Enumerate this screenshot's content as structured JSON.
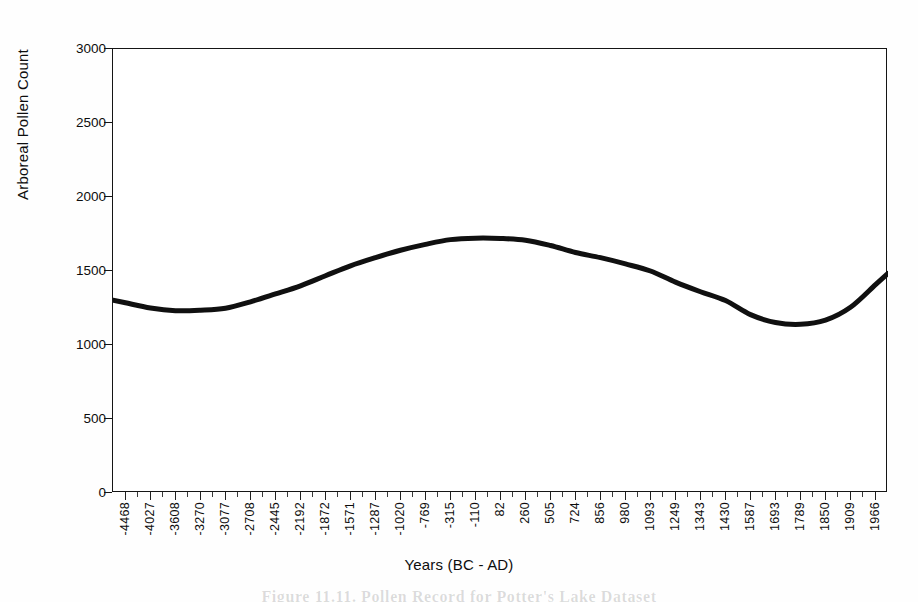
{
  "chart_data": {
    "type": "line",
    "title": "",
    "xlabel": "Years (BC - AD)",
    "ylabel": "Arboreal Pollen Count",
    "ylim": [
      0,
      3000
    ],
    "yticks": [
      0,
      500,
      1000,
      1500,
      2000,
      2500,
      3000
    ],
    "grid": false,
    "legend": null,
    "line_color": "#101010",
    "line_width_px": 5,
    "categories": [
      "-4468",
      "-4027",
      "-3608",
      "-3270",
      "-3077",
      "-2708",
      "-2445",
      "-2192",
      "-1872",
      "-1571",
      "-1287",
      "-1020",
      "-769",
      "-315",
      "-110",
      "82",
      "260",
      "505",
      "724",
      "856",
      "980",
      "1093",
      "1249",
      "1343",
      "1430",
      "1587",
      "1693",
      "1789",
      "1850",
      "1909",
      "1966"
    ],
    "tick_labels": [
      "-4468",
      "-4027",
      "-3608",
      "-3270",
      "-3077",
      "-2708",
      "-2445",
      "-2192",
      "-1872",
      "-1571",
      "-1287",
      "-1020",
      "-769",
      "-315",
      "-110",
      "82",
      "260",
      "505",
      "724",
      "856",
      "980",
      "1093",
      "1249",
      "1343",
      "1430",
      "1587",
      "1693",
      "1789",
      "1850",
      "1909",
      "1966"
    ],
    "values": [
      1285,
      1250,
      1232,
      1235,
      1248,
      1292,
      1345,
      1400,
      1468,
      1535,
      1590,
      1640,
      1680,
      1712,
      1722,
      1720,
      1708,
      1672,
      1625,
      1590,
      1548,
      1500,
      1425,
      1360,
      1300,
      1205,
      1152,
      1140,
      1168,
      1255,
      1408
    ],
    "annotations": []
  },
  "figure": {
    "y_axis_title": "Arboreal Pollen Count",
    "x_axis_title": "Years (BC - AD)",
    "caption_remnant": "Figure 11.11. Pollen Record for Potter's Lake Dataset"
  }
}
